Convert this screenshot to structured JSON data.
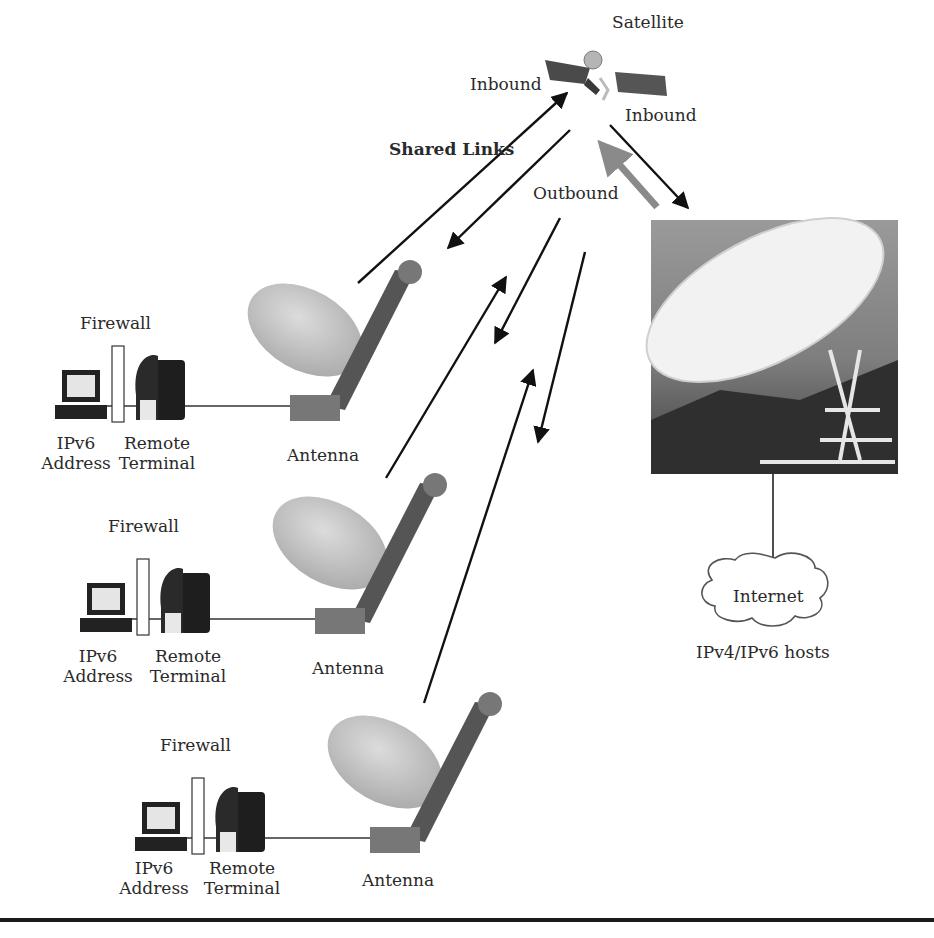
{
  "diagram": {
    "satellite": {
      "label": "Satellite",
      "inbound_left": "Inbound",
      "inbound_right": "Inbound"
    },
    "links": {
      "shared_label": "Shared Links",
      "outbound_label": "Outbound"
    },
    "ground_station": {
      "internet_label": "Internet",
      "hosts_label": "IPv4/IPv6 hosts"
    },
    "sites": [
      {
        "firewall": "Firewall",
        "host_line1": "IPv6",
        "host_line2": "Address",
        "terminal_line1": "Remote",
        "terminal_line2": "Terminal",
        "antenna": "Antenna"
      },
      {
        "firewall": "Firewall",
        "host_line1": "IPv6",
        "host_line2": "Address",
        "terminal_line1": "Remote",
        "terminal_line2": "Terminal",
        "antenna": "Antenna"
      },
      {
        "firewall": "Firewall",
        "host_line1": "IPv6",
        "host_line2": "Address",
        "terminal_line1": "Remote",
        "terminal_line2": "Terminal",
        "antenna": "Antenna"
      }
    ],
    "colors": {
      "arrow": "#111111",
      "outbound_arrow": "#8a8a8a",
      "dish": "#bdbdbd",
      "sky": "#8c8c8c"
    }
  }
}
